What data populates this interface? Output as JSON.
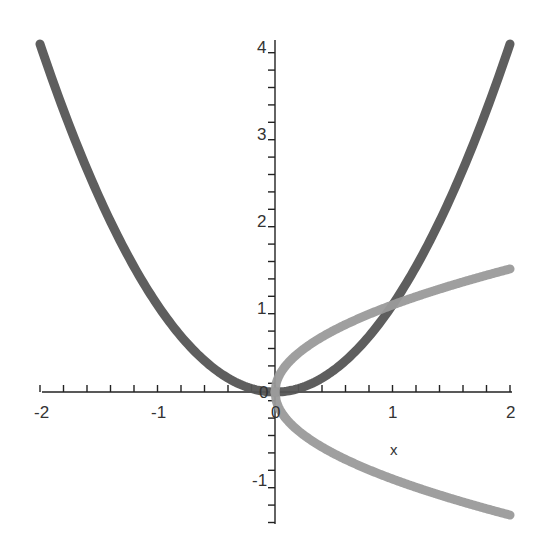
{
  "chart_data": {
    "type": "line",
    "title": "",
    "xlabel": "x",
    "ylabel": "",
    "xlim": [
      -2,
      2
    ],
    "ylim": [
      -1.5,
      4
    ],
    "grid": false,
    "legend": null,
    "x_ticks": [
      "-2",
      "-1",
      "0",
      "1",
      "2"
    ],
    "y_ticks": [
      "-1",
      "0",
      "1",
      "2",
      "3",
      "4"
    ],
    "series": [
      {
        "name": "x^2",
        "color": "#555555",
        "x": [
          -2,
          -1.5,
          -1,
          -0.5,
          0,
          0.5,
          1,
          1.5,
          2
        ],
        "values": [
          4,
          2.25,
          1,
          0.25,
          0,
          0.25,
          1,
          2.25,
          4
        ]
      },
      {
        "name": "sqrt(x)",
        "color": "#999999",
        "x": [
          0,
          0.25,
          0.5,
          1,
          1.5,
          2
        ],
        "values": [
          0,
          0.5,
          0.707,
          1,
          1.225,
          1.414
        ]
      },
      {
        "name": "-sqrt(x)",
        "color": "#999999",
        "x": [
          0,
          0.25,
          0.5,
          1,
          1.5,
          2
        ],
        "values": [
          0,
          -0.5,
          -0.707,
          -1,
          -1.225,
          -1.414
        ]
      }
    ]
  },
  "axes": {
    "x_axis_label": "x",
    "x_tick_labels": [
      "-2",
      "-1",
      "0",
      "1",
      "2"
    ],
    "y_tick_labels": [
      "4",
      "3",
      "2",
      "1",
      "-1"
    ],
    "origin_label_x": "0",
    "origin_label_y": "0"
  }
}
